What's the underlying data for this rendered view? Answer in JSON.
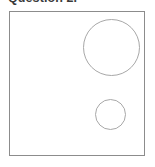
{
  "page": {
    "width": 155,
    "height": 167,
    "background_color": "#ffffff"
  },
  "heading": {
    "text": "Question 2.",
    "color": "#3a3a3a",
    "style": "bold",
    "clipped_at_top": true
  },
  "figure": {
    "name": "two-circles-figure",
    "frame": {
      "border_color": "#8c8c8c",
      "fill_color": "#ffffff",
      "x": 9,
      "y": 11,
      "width": 136,
      "height": 145
    },
    "shapes": [
      {
        "name": "large-circle",
        "type": "circle",
        "center_x": 111,
        "center_y": 47,
        "radius": 28,
        "stroke_color": "#a8a8a8",
        "fill": "none"
      },
      {
        "name": "small-circle",
        "type": "circle",
        "center_x": 110,
        "center_y": 114,
        "radius": 15,
        "stroke_color": "#a8a8a8",
        "fill": "none"
      }
    ]
  }
}
